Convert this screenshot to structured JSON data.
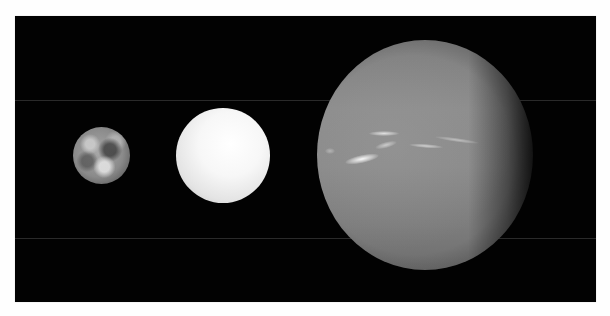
{
  "image": {
    "subject": "planet size comparison",
    "background_color": "#020202",
    "frame_color": "#ffffff",
    "palette": "grayscale"
  },
  "planets": [
    {
      "name": "earth",
      "label": "",
      "center": [
        101,
        155
      ],
      "radius": 28
    },
    {
      "name": "white-planet",
      "label": "",
      "center": [
        223,
        155
      ],
      "radius": 47
    },
    {
      "name": "neptune",
      "label": "",
      "center": [
        425,
        155
      ],
      "radius": 115
    }
  ]
}
